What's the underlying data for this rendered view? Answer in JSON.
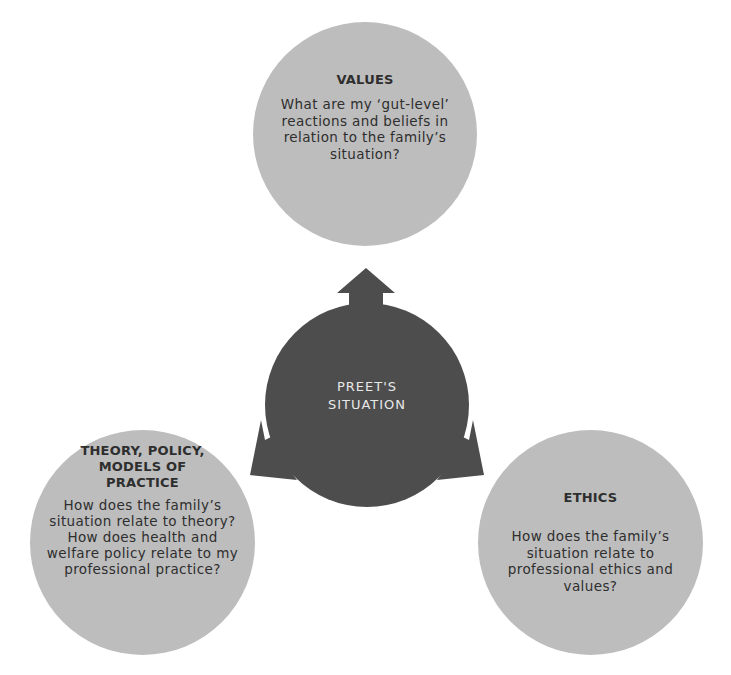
{
  "diagram": {
    "center": {
      "label_line1": "PREET'S",
      "label_line2": "SITUATION",
      "color": "#4d4d4d"
    },
    "nodes": [
      {
        "title": "VALUES",
        "text": "What are my ‘gut-level’ reactions and beliefs in relation to the family’s situation?"
      },
      {
        "title": "THEORY, POLICY, MODELS OF PRACTICE",
        "text": "How does the family’s situation relate to theory? How does health and welfare policy relate to my professional practice?"
      },
      {
        "title": "ETHICS",
        "text": "How does the family’s situation relate to professional ethics and values?"
      }
    ],
    "node_color": "#bdbdbd"
  }
}
